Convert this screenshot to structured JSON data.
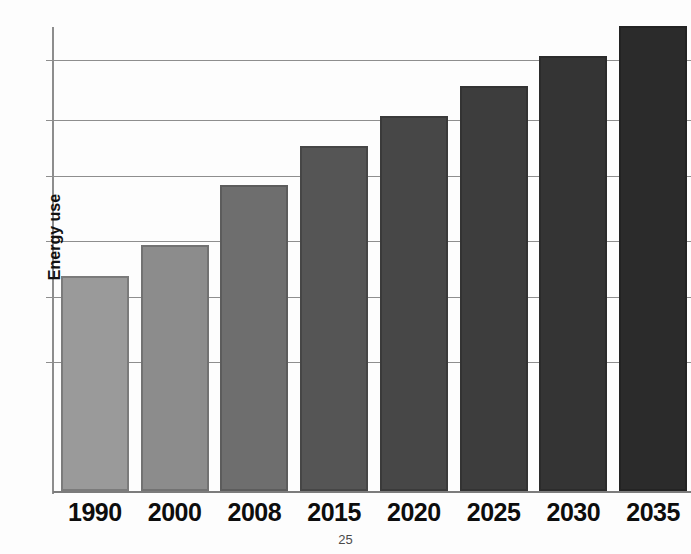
{
  "page": {
    "number": "25",
    "background_color": "#fdfdfd"
  },
  "chart_data": {
    "type": "bar",
    "title": "World energy use",
    "title_clipped": true,
    "xlabel": "",
    "ylabel": "Energy use",
    "categories": [
      "1990",
      "2000",
      "2008",
      "2015",
      "2020",
      "2025",
      "2030",
      "2035"
    ],
    "values": [
      50,
      57,
      71,
      80,
      87,
      94,
      101,
      108
    ],
    "ylim": [
      0,
      110
    ],
    "y_tick_labels": [],
    "grid": true,
    "gridline_values": [
      30,
      45,
      58,
      73,
      86,
      100
    ],
    "legend": "none",
    "bar_colors": [
      "#9a9a9a",
      "#8c8c8c",
      "#6e6e6e",
      "#555555",
      "#474747",
      "#3d3d3d",
      "#343434",
      "#2b2b2b"
    ],
    "bar_border_colors": [
      "#7b7b7b",
      "#727272",
      "#5c5c5c",
      "#464646",
      "#3a3a3a",
      "#333333",
      "#2b2b2b",
      "#232323"
    ]
  },
  "axis": {
    "line_color": "#8d8d8d",
    "gridline_color": "#8e8e8e"
  }
}
